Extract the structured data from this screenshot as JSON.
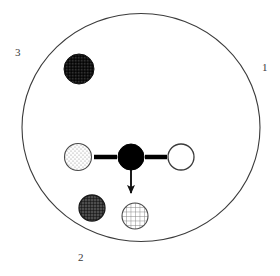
{
  "figure": {
    "background_color": "#ffffff",
    "boundary": {
      "name": "outer-circle",
      "shape": "ellipse",
      "cx": 141,
      "cy": 127.5,
      "rx": 119,
      "ry": 114,
      "stroke": "#3b3b3b",
      "stroke_width": 1.1,
      "fill": "none"
    },
    "sector_labels": [
      {
        "id": "1",
        "text": "1",
        "x": 262,
        "y": 62
      },
      {
        "id": "2",
        "text": "2",
        "x": 78,
        "y": 252
      },
      {
        "id": "3",
        "text": "3",
        "x": 15,
        "y": 47
      }
    ],
    "nodes": [
      {
        "id": "node-top-dark",
        "label": "dark-stippled-circle",
        "cx": 79,
        "cy": 69,
        "r": 15,
        "fill_style": "dark-stipple",
        "fill_color": "#1a1a1a",
        "stroke": "#111111",
        "stroke_width": 1
      },
      {
        "id": "node-left-stippled",
        "label": "light-stippled-circle",
        "cx": 78,
        "cy": 157,
        "r": 13.5,
        "fill_style": "light-stipple",
        "fill_color": "#fdfdfd",
        "stroke": "#4a4a4a",
        "stroke_width": 1.1
      },
      {
        "id": "node-center-black",
        "label": "solid-black-circle",
        "cx": 131,
        "cy": 157,
        "r": 13,
        "fill_style": "solid",
        "fill_color": "#000000",
        "stroke": "#000000",
        "stroke_width": 1
      },
      {
        "id": "node-right-white",
        "label": "open-white-circle",
        "cx": 181,
        "cy": 157,
        "r": 13,
        "fill_style": "open",
        "fill_color": "#ffffff",
        "stroke": "#3b3b3b",
        "stroke_width": 1.2
      },
      {
        "id": "node-lower-left-crosshatch",
        "label": "dark-crosshatch-circle",
        "cx": 92,
        "cy": 208,
        "r": 13,
        "fill_style": "dark-grid",
        "fill_color": "#3d3d3d",
        "stroke": "#1a1a1a",
        "stroke_width": 1.2
      },
      {
        "id": "node-lower-mid-grid",
        "label": "light-grid-circle",
        "cx": 135,
        "cy": 216,
        "r": 13,
        "fill_style": "light-grid",
        "fill_color": "#ffffff",
        "stroke": "#4a4a4a",
        "stroke_width": 1.1
      }
    ],
    "connectors": [
      {
        "id": "connector-left",
        "label": "thick-link-center-to-left",
        "x1": 94,
        "y1": 157,
        "x2": 117,
        "y2": 157,
        "stroke": "#000000",
        "stroke_width": 4.5
      },
      {
        "id": "connector-right",
        "label": "thick-link-center-to-right",
        "x1": 145,
        "y1": 157,
        "x2": 167,
        "y2": 157,
        "stroke": "#000000",
        "stroke_width": 4.5
      }
    ],
    "arrow": {
      "id": "arrow-down",
      "label": "downward-arrow-from-center",
      "x": 131,
      "y_start": 170,
      "y_end": 198,
      "stroke": "#111111",
      "stroke_width": 1.8,
      "head_width": 7,
      "head_length": 8
    }
  }
}
